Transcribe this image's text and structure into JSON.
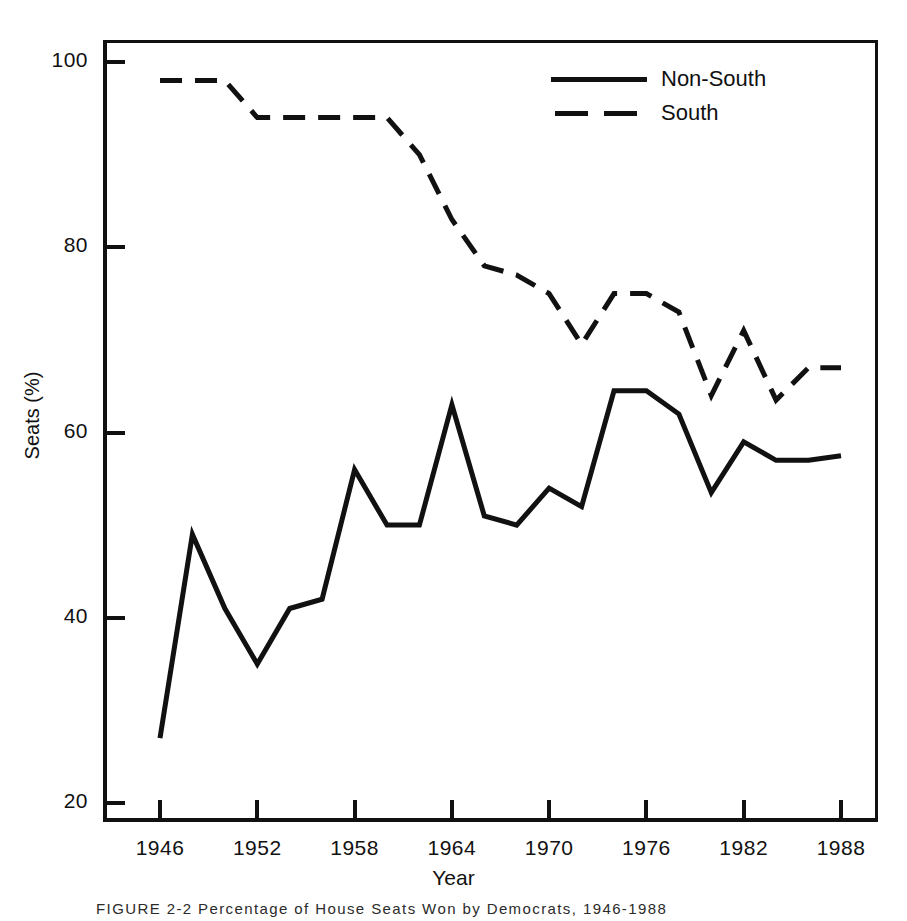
{
  "figure": {
    "caption": "FIGURE 2-2  Percentage of House Seats Won by Democrats, 1946-1988"
  },
  "axes": {
    "ylabel": "Seats (%)",
    "xlabel": "Year",
    "yticks": [
      20,
      40,
      60,
      80,
      100
    ],
    "ytick_labels": [
      "20",
      "40",
      "60",
      "80",
      "100"
    ],
    "xticks": [
      1946,
      1952,
      1958,
      1964,
      1970,
      1976,
      1982,
      1988
    ],
    "xtick_labels": [
      "1946",
      "1952",
      "1958",
      "1964",
      "1970",
      "1976",
      "1982",
      "1988"
    ]
  },
  "legend": {
    "position": "top-right",
    "items": [
      {
        "label": "Non-South",
        "style": "solid"
      },
      {
        "label": "South",
        "style": "dashed"
      }
    ]
  },
  "colors": {
    "line": "#111111",
    "frame": "#111111",
    "background": "#ffffff",
    "text": "#111111"
  },
  "chart_data": {
    "type": "line",
    "title": "",
    "xlabel": "Year",
    "ylabel": "Seats (%)",
    "xlim": [
      1944,
      1990
    ],
    "ylim": [
      16,
      104
    ],
    "grid": false,
    "legend_position": "top-right",
    "x": [
      1946,
      1948,
      1950,
      1952,
      1954,
      1956,
      1958,
      1960,
      1962,
      1964,
      1966,
      1968,
      1970,
      1972,
      1974,
      1976,
      1978,
      1980,
      1982,
      1984,
      1986,
      1988
    ],
    "series": [
      {
        "name": "Non-South",
        "style": "solid",
        "values": [
          27,
          49,
          41,
          35,
          41,
          42,
          56,
          50,
          50,
          63,
          51,
          50,
          54,
          52,
          64.5,
          64.5,
          62,
          53.5,
          59,
          57,
          57,
          57.5
        ]
      },
      {
        "name": "South",
        "style": "dashed",
        "values": [
          98,
          98,
          98,
          94,
          94,
          94,
          94,
          94,
          90,
          83,
          78,
          77,
          75,
          69.5,
          75,
          75,
          73,
          64,
          71,
          63.5,
          67,
          67
        ]
      }
    ]
  }
}
